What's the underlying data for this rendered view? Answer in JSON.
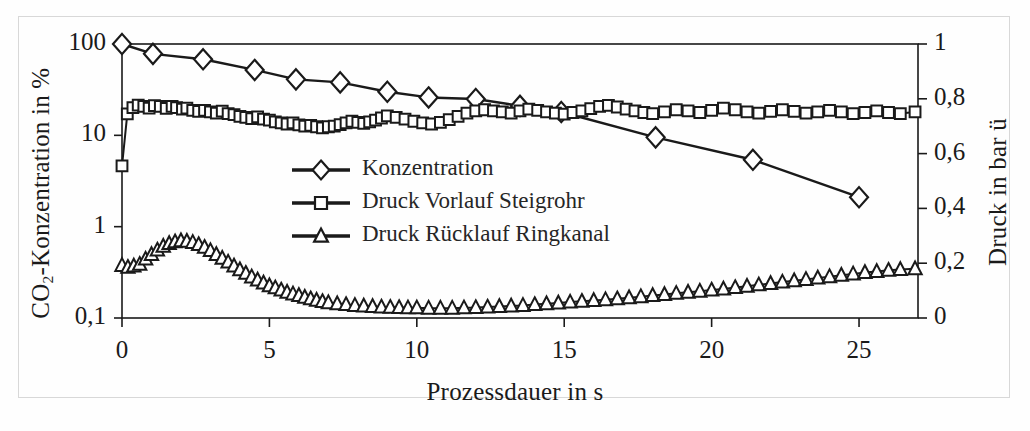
{
  "figure": {
    "background_color": "#fefefe",
    "frame_color": "#d8d8d8",
    "line_color": "#1a1a1a"
  },
  "axes": {
    "left": {
      "title_prefix": "CO",
      "title_sub": "2",
      "title_suffix": "-Konzentration in %",
      "scale": "log",
      "ticks": [
        "100",
        "10",
        "1",
        "0,1"
      ],
      "tick_values": [
        100,
        10,
        1,
        0.1
      ],
      "range": [
        0.1,
        100
      ]
    },
    "right": {
      "title": "Druck in bar ü",
      "scale": "linear",
      "ticks": [
        "1",
        "0,8",
        "0,6",
        "0,4",
        "0,2",
        "0"
      ],
      "tick_values": [
        1,
        0.8,
        0.6,
        0.4,
        0.2,
        0
      ],
      "range": [
        0,
        1
      ]
    },
    "bottom": {
      "title": "Prozessdauer in s",
      "ticks": [
        "0",
        "5",
        "10",
        "15",
        "20",
        "25"
      ],
      "tick_values": [
        0,
        5,
        10,
        15,
        20,
        25
      ],
      "range": [
        0,
        27
      ]
    }
  },
  "legend": {
    "position": "center-left-inside",
    "items": [
      {
        "label": "Konzentration",
        "marker": "diamond",
        "axis": "left"
      },
      {
        "label": "Druck Vorlauf Steigrohr",
        "marker": "square",
        "axis": "right"
      },
      {
        "label": "Druck Rücklauf Ringkanal",
        "marker": "triangle",
        "axis": "right"
      }
    ]
  },
  "chart_data": {
    "type": "line",
    "title": "",
    "xlabel": "Prozessdauer in s",
    "ylabel": "CO2-Konzentration in %",
    "ylabel_secondary": "Druck in bar ü",
    "xlim": [
      0,
      27
    ],
    "ylim": [
      0.1,
      100
    ],
    "ylim_secondary": [
      0,
      1
    ],
    "yscale": "log",
    "grid": false,
    "legend_position": "center-left-inside",
    "series": [
      {
        "name": "Konzentration",
        "marker": "diamond",
        "axis": "left",
        "unit": "%",
        "x": [
          0,
          1.05,
          2.75,
          4.5,
          5.9,
          7.4,
          9.0,
          10.4,
          12.0,
          13.5,
          14.9,
          18.1,
          21.4,
          25.0
        ],
        "y": [
          100,
          78,
          68,
          52,
          41,
          38,
          30,
          26,
          25,
          21,
          18,
          9.5,
          5.4,
          2.1
        ]
      },
      {
        "name": "Druck Vorlauf Steigrohr",
        "marker": "square",
        "axis": "right",
        "unit": "bar",
        "x": [
          0,
          0.18,
          0.37,
          0.55,
          0.74,
          0.92,
          1.1,
          1.3,
          1.5,
          1.7,
          1.85,
          2.05,
          2.2,
          2.4,
          2.6,
          2.8,
          3.0,
          3.2,
          3.4,
          3.6,
          3.8,
          4.0,
          4.2,
          4.4,
          4.6,
          4.8,
          5.0,
          5.2,
          5.4,
          5.6,
          5.8,
          6.0,
          6.2,
          6.4,
          6.6,
          6.8,
          7.0,
          7.2,
          7.4,
          7.6,
          7.8,
          8.0,
          8.2,
          8.4,
          8.6,
          8.8,
          9.0,
          9.3,
          9.6,
          9.9,
          10.2,
          10.5,
          10.8,
          11.1,
          11.4,
          11.7,
          12.0,
          12.3,
          12.6,
          12.9,
          13.2,
          13.5,
          13.8,
          14.1,
          14.4,
          14.7,
          15.0,
          15.3,
          15.6,
          15.9,
          16.2,
          16.5,
          16.8,
          17.1,
          17.4,
          17.7,
          18.0,
          18.4,
          18.8,
          19.2,
          19.6,
          20.0,
          20.4,
          20.8,
          21.2,
          21.6,
          22.0,
          22.4,
          22.8,
          23.2,
          23.6,
          24.0,
          24.4,
          24.8,
          25.2,
          25.6,
          26.0,
          26.4,
          26.9
        ],
        "y": [
          0.555,
          0.745,
          0.768,
          0.777,
          0.772,
          0.766,
          0.775,
          0.772,
          0.765,
          0.772,
          0.768,
          0.762,
          0.766,
          0.758,
          0.754,
          0.758,
          0.752,
          0.748,
          0.755,
          0.746,
          0.742,
          0.736,
          0.732,
          0.728,
          0.734,
          0.726,
          0.722,
          0.716,
          0.712,
          0.708,
          0.712,
          0.705,
          0.7,
          0.703,
          0.698,
          0.694,
          0.698,
          0.7,
          0.706,
          0.712,
          0.718,
          0.714,
          0.71,
          0.716,
          0.722,
          0.73,
          0.738,
          0.732,
          0.726,
          0.718,
          0.712,
          0.708,
          0.714,
          0.724,
          0.736,
          0.748,
          0.756,
          0.76,
          0.756,
          0.752,
          0.748,
          0.756,
          0.762,
          0.758,
          0.752,
          0.748,
          0.744,
          0.75,
          0.756,
          0.764,
          0.772,
          0.776,
          0.77,
          0.762,
          0.756,
          0.75,
          0.746,
          0.752,
          0.76,
          0.756,
          0.75,
          0.758,
          0.766,
          0.76,
          0.752,
          0.748,
          0.754,
          0.76,
          0.754,
          0.748,
          0.752,
          0.758,
          0.752,
          0.746,
          0.75,
          0.756,
          0.75,
          0.746,
          0.752
        ]
      },
      {
        "name": "Druck Rücklauf Ringkanal",
        "marker": "triangle",
        "axis": "right",
        "unit": "bar",
        "x": [
          0,
          0.2,
          0.4,
          0.6,
          0.8,
          1.0,
          1.2,
          1.4,
          1.6,
          1.8,
          2.0,
          2.2,
          2.4,
          2.6,
          2.8,
          3.0,
          3.2,
          3.4,
          3.6,
          3.8,
          4.0,
          4.2,
          4.4,
          4.6,
          4.8,
          5.0,
          5.2,
          5.4,
          5.6,
          5.8,
          6.0,
          6.2,
          6.4,
          6.6,
          6.8,
          7.0,
          7.3,
          7.6,
          7.9,
          8.2,
          8.5,
          8.8,
          9.1,
          9.4,
          9.7,
          10.0,
          10.4,
          10.8,
          11.2,
          11.6,
          12.0,
          12.4,
          12.8,
          13.2,
          13.6,
          14.0,
          14.4,
          14.8,
          15.2,
          15.6,
          16.0,
          16.4,
          16.8,
          17.2,
          17.6,
          18.0,
          18.4,
          18.8,
          19.2,
          19.6,
          20.0,
          20.4,
          20.8,
          21.2,
          21.6,
          22.0,
          22.4,
          22.8,
          23.2,
          23.6,
          24.0,
          24.4,
          24.8,
          25.2,
          25.6,
          26.0,
          26.4,
          26.9
        ],
        "y": [
          0.192,
          0.185,
          0.19,
          0.196,
          0.215,
          0.232,
          0.248,
          0.262,
          0.272,
          0.278,
          0.282,
          0.28,
          0.276,
          0.268,
          0.258,
          0.246,
          0.232,
          0.218,
          0.204,
          0.19,
          0.176,
          0.163,
          0.15,
          0.139,
          0.128,
          0.118,
          0.11,
          0.102,
          0.094,
          0.088,
          0.082,
          0.076,
          0.07,
          0.065,
          0.06,
          0.056,
          0.052,
          0.049,
          0.046,
          0.044,
          0.042,
          0.04,
          0.039,
          0.038,
          0.037,
          0.037,
          0.036,
          0.036,
          0.036,
          0.037,
          0.038,
          0.04,
          0.042,
          0.044,
          0.046,
          0.049,
          0.052,
          0.055,
          0.058,
          0.061,
          0.064,
          0.067,
          0.07,
          0.074,
          0.078,
          0.082,
          0.086,
          0.09,
          0.094,
          0.098,
          0.102,
          0.106,
          0.111,
          0.116,
          0.121,
          0.126,
          0.131,
          0.136,
          0.141,
          0.146,
          0.151,
          0.156,
          0.161,
          0.166,
          0.17,
          0.174,
          0.177,
          0.18
        ]
      }
    ]
  }
}
